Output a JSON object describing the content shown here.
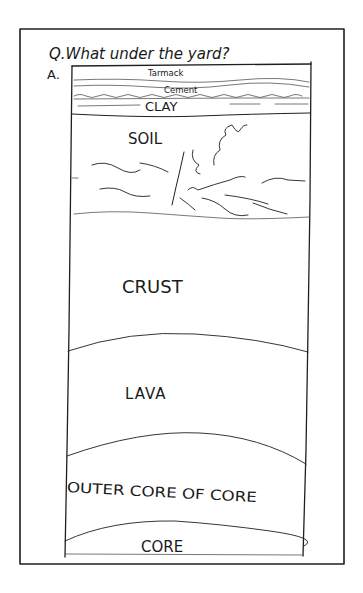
{
  "question": "Q.What under the yard?",
  "answer_label": "A.",
  "layers": [
    {
      "name": "tarmac",
      "label": "Tarmack"
    },
    {
      "name": "cement",
      "label": "Cement"
    },
    {
      "name": "clay",
      "label": "CLAY"
    },
    {
      "name": "soil",
      "label": "SOIL"
    },
    {
      "name": "crust",
      "label": "CRUST"
    },
    {
      "name": "lava",
      "label": "LAVA"
    },
    {
      "name": "outer-core",
      "label": "OUTER CORE OF CORE"
    },
    {
      "name": "core",
      "label": "CORE"
    }
  ],
  "colors": {
    "ink": "#1f1f1f",
    "paper": "#ffffff"
  }
}
